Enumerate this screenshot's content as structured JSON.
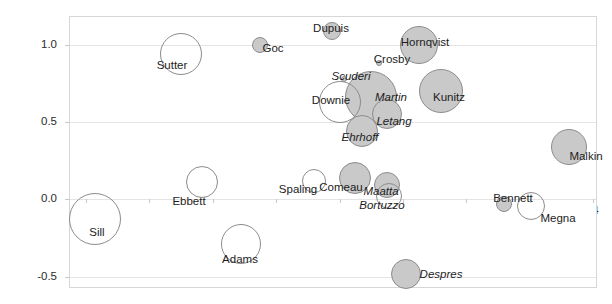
{
  "chart_data": {
    "type": "scatter",
    "title": "",
    "xlabel": "",
    "ylabel": "Quality of Competition",
    "xlim": [
      31.0,
      64.3
    ],
    "ylim": [
      -0.58,
      1.18
    ],
    "xticks": [
      32,
      36,
      40,
      44,
      48,
      52,
      56,
      60,
      64
    ],
    "xtick_labels": [
      "32",
      "36",
      "40",
      "44",
      "48",
      "52",
      "56",
      "60",
      "64"
    ],
    "yticks": [
      1.0,
      0.5,
      0.0,
      -0.5
    ],
    "ytick_labels": [
      "1.0",
      "0.5",
      "0.0",
      "-0.5"
    ],
    "grid": "horizontal",
    "legend": "none",
    "size_encoding": "bubble area",
    "points": [
      {
        "label": "Dupuis",
        "x": 47.5,
        "y": 1.09,
        "r": 9,
        "fill": "filled",
        "italic": false,
        "lx": 330,
        "ly": 27
      },
      {
        "label": "Hornqvist",
        "x": 53.0,
        "y": 1.0,
        "r": 19,
        "fill": "filled",
        "italic": false,
        "lx": 424,
        "ly": 41
      },
      {
        "label": "Goc",
        "x": 43.0,
        "y": 1.0,
        "r": 8,
        "fill": "filled",
        "italic": false,
        "lx": 272,
        "ly": 47
      },
      {
        "label": "Sutter",
        "x": 38.0,
        "y": 0.94,
        "r": 21,
        "fill": "hollow",
        "italic": false,
        "lx": 171,
        "ly": 64
      },
      {
        "label": "Crosby",
        "x": 50.5,
        "y": 0.88,
        "r": 3,
        "fill": "filled",
        "italic": false,
        "lx": 391,
        "ly": 58
      },
      {
        "label": "Scuderi",
        "x": 48.3,
        "y": 0.78,
        "r": 3,
        "fill": "filled",
        "italic": true,
        "lx": 350,
        "ly": 75
      },
      {
        "label": "Kunitz",
        "x": 54.4,
        "y": 0.7,
        "r": 22,
        "fill": "filled",
        "italic": false,
        "lx": 448,
        "ly": 96
      },
      {
        "label": "Martin",
        "x": 50.0,
        "y": 0.66,
        "r": 26,
        "fill": "filled",
        "italic": true,
        "lx": 390,
        "ly": 96
      },
      {
        "label": "Downie",
        "x": 48.0,
        "y": 0.63,
        "r": 21,
        "fill": "hollow",
        "italic": false,
        "lx": 330,
        "ly": 99
      },
      {
        "label": "Letang",
        "x": 51.0,
        "y": 0.55,
        "r": 15,
        "fill": "filled",
        "italic": true,
        "lx": 393,
        "ly": 120
      },
      {
        "label": "Ehrhoff",
        "x": 49.4,
        "y": 0.44,
        "r": 16,
        "fill": "filled",
        "italic": true,
        "lx": 359,
        "ly": 136
      },
      {
        "label": "Malkin",
        "x": 62.5,
        "y": 0.34,
        "r": 18,
        "fill": "filled",
        "italic": false,
        "lx": 585,
        "ly": 155
      },
      {
        "label": "Comeau",
        "x": 49.0,
        "y": 0.14,
        "r": 16,
        "fill": "filled",
        "italic": false,
        "lx": 340,
        "ly": 186
      },
      {
        "label": "Ebbett",
        "x": 39.3,
        "y": 0.11,
        "r": 16,
        "fill": "hollow",
        "italic": false,
        "lx": 188,
        "ly": 200
      },
      {
        "label": "Spaling",
        "x": 46.4,
        "y": 0.12,
        "r": 12,
        "fill": "hollow",
        "italic": false,
        "lx": 297,
        "ly": 188
      },
      {
        "label": "Maatta",
        "x": 51.0,
        "y": 0.09,
        "r": 13,
        "fill": "filled",
        "italic": true,
        "lx": 380,
        "ly": 190
      },
      {
        "label": "Bortuzzo",
        "x": 51.1,
        "y": 0.02,
        "r": 13,
        "fill": "hollow",
        "italic": true,
        "lx": 381,
        "ly": 204
      },
      {
        "label": "Bennett",
        "x": 58.4,
        "y": -0.03,
        "r": 8,
        "fill": "filled",
        "italic": false,
        "lx": 512,
        "ly": 197
      },
      {
        "label": "Megna",
        "x": 60.1,
        "y": -0.04,
        "r": 14,
        "fill": "hollow",
        "italic": false,
        "lx": 557,
        "ly": 217
      },
      {
        "label": "Sill",
        "x": 32.6,
        "y": -0.13,
        "r": 26,
        "fill": "hollow",
        "italic": false,
        "lx": 96,
        "ly": 231
      },
      {
        "label": "Adams",
        "x": 41.8,
        "y": -0.29,
        "r": 20,
        "fill": "hollow",
        "italic": false,
        "lx": 239,
        "ly": 258
      },
      {
        "label": "Despres",
        "x": 52.2,
        "y": -0.48,
        "r": 15,
        "fill": "filled",
        "italic": true,
        "lx": 440,
        "ly": 273
      }
    ]
  }
}
